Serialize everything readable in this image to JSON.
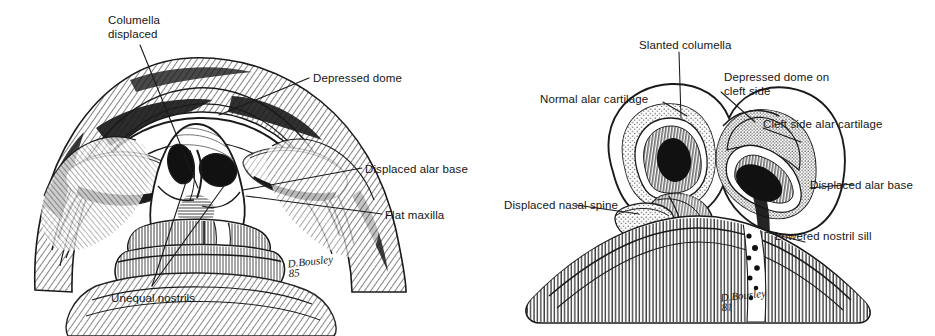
{
  "figure": {
    "background_color": "#ffffff",
    "ink_color": "#1a1a1a",
    "panel_count": 2
  },
  "panels": [
    {
      "id": "left",
      "view": "basal (worm's-eye) view of face with unilateral cleft lip nasal deformity",
      "signature": {
        "name": "D. Bousley",
        "year": "85",
        "text": "D.Bousley\n85"
      },
      "labels": [
        {
          "id": "columella-displaced",
          "text": "Columella\ndisplaced",
          "lines": 2,
          "x": 108,
          "y": 14,
          "anchor": "left"
        },
        {
          "id": "depressed-dome",
          "text": "Depressed dome",
          "lines": 1,
          "x": 313,
          "y": 72,
          "anchor": "left"
        },
        {
          "id": "displaced-alar-base",
          "text": "Displaced alar base",
          "lines": 1,
          "x": 365,
          "y": 163,
          "anchor": "left"
        },
        {
          "id": "flat-maxilla",
          "text": "Flat maxilla",
          "lines": 1,
          "x": 385,
          "y": 209,
          "anchor": "left"
        },
        {
          "id": "unequal-nostrils",
          "text": "Unequal nostrils",
          "lines": 1,
          "x": 111,
          "y": 292,
          "anchor": "left"
        }
      ]
    },
    {
      "id": "right",
      "view": "basal view of nasal cartilage framework showing cleft side deformity",
      "signature": {
        "name": "D. Bousley",
        "year": "81",
        "text": "D.Bousley\n81"
      },
      "labels": [
        {
          "id": "slanted-columella",
          "text": "Slanted columella",
          "lines": 1,
          "x": 639,
          "y": 39,
          "anchor": "left"
        },
        {
          "id": "depressed-dome-cleft",
          "text": "Depressed dome on\ncleft side",
          "lines": 2,
          "x": 724,
          "y": 71,
          "anchor": "left"
        },
        {
          "id": "normal-alar-cartilage",
          "text": "Normal alar cartilage",
          "lines": 1,
          "x": 540,
          "y": 93,
          "anchor": "left"
        },
        {
          "id": "cleft-side-alar-cartilage",
          "text": "Cleft side alar cartilage",
          "lines": 1,
          "x": 763,
          "y": 118,
          "anchor": "left"
        },
        {
          "id": "displaced-alar-base-r",
          "text": "Displaced alar base",
          "lines": 1,
          "x": 810,
          "y": 179,
          "anchor": "left"
        },
        {
          "id": "displaced-nasal-spine",
          "text": "Displaced nasal spine",
          "lines": 1,
          "x": 504,
          "y": 199,
          "anchor": "left"
        },
        {
          "id": "lowered-nostril-sill",
          "text": "Lowered nostril sill",
          "lines": 1,
          "x": 775,
          "y": 230,
          "anchor": "left"
        }
      ]
    }
  ]
}
